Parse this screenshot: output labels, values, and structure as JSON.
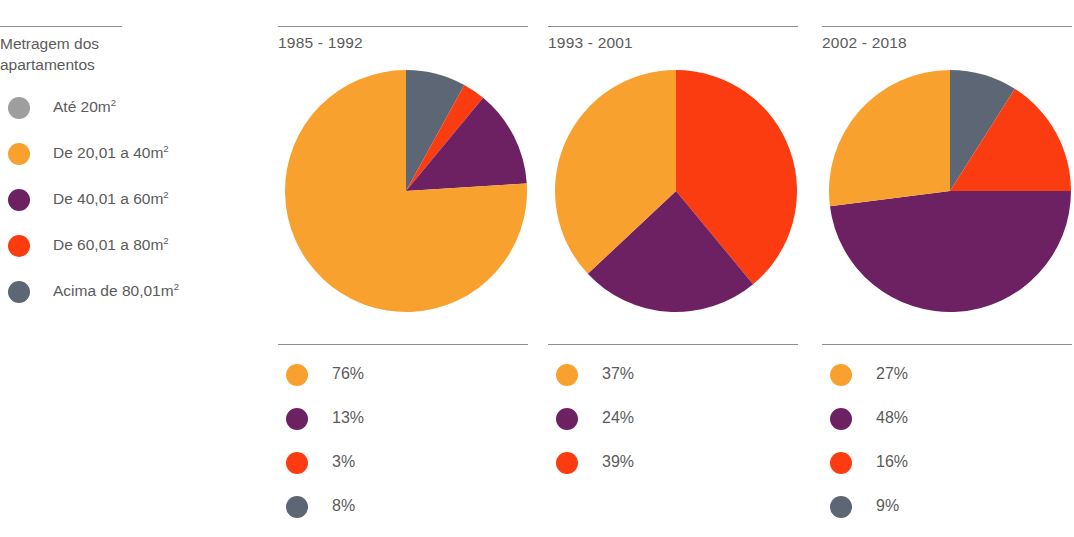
{
  "legend": {
    "heading_line1": "Metragem dos",
    "heading_line2": "apartamentos",
    "items": [
      {
        "label": "Até 20m",
        "sup": "2",
        "color": "#9e9e9e",
        "key": "ate-20m2"
      },
      {
        "label": "De 20,01 a 40m",
        "sup": "2",
        "color": "#f9a12e",
        "key": "de-20-01-a-40m2"
      },
      {
        "label": "De 40,01 a 60m",
        "sup": "2",
        "color": "#6d2062",
        "key": "de-40-01-a-60m2"
      },
      {
        "label": "De 60,01 a 80m",
        "sup": "2",
        "color": "#fa3c10",
        "key": "de-60-01-a-80m2"
      },
      {
        "label": "Acima de 80,01m",
        "sup": "2",
        "color": "#5c6675",
        "key": "acima-de-80-01m2"
      }
    ]
  },
  "columns": [
    {
      "title": "1985 - 1992",
      "percent_rows": [
        {
          "color": "#f9a12e",
          "value": "76%"
        },
        {
          "color": "#6d2062",
          "value": "13%"
        },
        {
          "color": "#fa3c10",
          "value": "3%"
        },
        {
          "color": "#5c6675",
          "value": "8%"
        }
      ]
    },
    {
      "title": "1993 - 2001",
      "percent_rows": [
        {
          "color": "#f9a12e",
          "value": "37%"
        },
        {
          "color": "#6d2062",
          "value": "24%"
        },
        {
          "color": "#fa3c10",
          "value": "39%"
        }
      ]
    },
    {
      "title": "2002 - 2018",
      "percent_rows": [
        {
          "color": "#f9a12e",
          "value": "27%"
        },
        {
          "color": "#6d2062",
          "value": "48%"
        },
        {
          "color": "#fa3c10",
          "value": "16%"
        },
        {
          "color": "#5c6675",
          "value": "9%"
        }
      ]
    }
  ],
  "chart_data": [
    {
      "type": "pie",
      "title": "1985 - 1992",
      "labels": [
        "Acima de 80,01m2",
        "De 60,01 a 80m2",
        "De 40,01 a 60m2",
        "De 20,01 a 40m2"
      ],
      "values": [
        8,
        3,
        13,
        76
      ],
      "colors": [
        "#5c6675",
        "#fa3c10",
        "#6d2062",
        "#f9a12e"
      ],
      "start_angle_deg": 0,
      "direction": "clockwise",
      "legend_position": "below"
    },
    {
      "type": "pie",
      "title": "1993 - 2001",
      "labels": [
        "De 60,01 a 80m2",
        "De 40,01 a 60m2",
        "De 20,01 a 40m2"
      ],
      "values": [
        39,
        24,
        37
      ],
      "colors": [
        "#fa3c10",
        "#6d2062",
        "#f9a12e"
      ],
      "start_angle_deg": 0,
      "direction": "clockwise",
      "legend_position": "below"
    },
    {
      "type": "pie",
      "title": "2002 - 2018",
      "labels": [
        "Acima de 80,01m2",
        "De 60,01 a 80m2",
        "De 40,01 a 60m2",
        "De 20,01 a 40m2"
      ],
      "values": [
        9,
        16,
        48,
        27
      ],
      "colors": [
        "#5c6675",
        "#fa3c10",
        "#6d2062",
        "#f9a12e"
      ],
      "start_angle_deg": 0,
      "direction": "clockwise",
      "legend_position": "below"
    }
  ]
}
